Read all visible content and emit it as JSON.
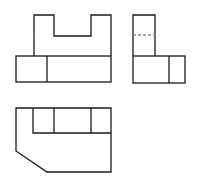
{
  "diagram": {
    "type": "orthographic-projection",
    "stroke_color": "#1a1a1a",
    "hidden_line_color": "#888888",
    "background": "#ffffff",
    "views": [
      {
        "name": "front-view",
        "position": "top-left"
      },
      {
        "name": "side-view",
        "position": "top-right"
      },
      {
        "name": "top-view",
        "position": "bottom-left"
      }
    ]
  }
}
